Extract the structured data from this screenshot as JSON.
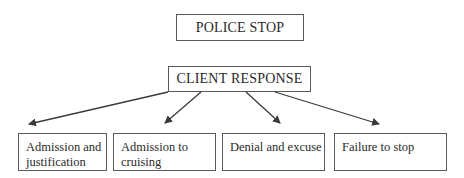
{
  "diagram": {
    "top_node": {
      "label": "POLICE STOP"
    },
    "middle_node": {
      "label": "CLIENT RESPONSE"
    },
    "leaf_nodes": [
      {
        "label": "Admission and justification"
      },
      {
        "label": "Admission to cruising"
      },
      {
        "label": "Denial and excuse"
      },
      {
        "label": "Failure to stop"
      }
    ],
    "edges": [
      {
        "from": "CLIENT RESPONSE",
        "to": "Admission and justification"
      },
      {
        "from": "CLIENT RESPONSE",
        "to": "Admission to cruising"
      },
      {
        "from": "CLIENT RESPONSE",
        "to": "Denial and excuse"
      },
      {
        "from": "CLIENT RESPONSE",
        "to": "Failure to stop"
      }
    ],
    "colors": {
      "line": "#3a3a3a",
      "border": "#5a5a5a",
      "text": "#2a2a2a"
    }
  }
}
